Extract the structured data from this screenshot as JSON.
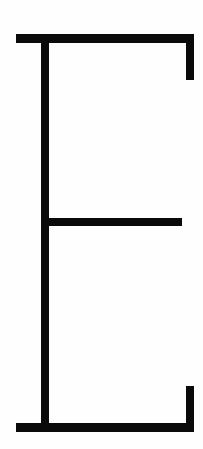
{
  "figure": {
    "letter": "E",
    "stroke_color": "#0a0a0a",
    "background_color": "#fefefe",
    "parts": [
      {
        "name": "top-bar",
        "x": 16,
        "y": 34,
        "w": 178,
        "h": 9
      },
      {
        "name": "top-serif",
        "x": 186,
        "y": 34,
        "w": 8,
        "h": 46
      },
      {
        "name": "stem",
        "x": 41,
        "y": 34,
        "w": 8,
        "h": 398
      },
      {
        "name": "middle-bar",
        "x": 41,
        "y": 218,
        "w": 141,
        "h": 8
      },
      {
        "name": "bottom-bar",
        "x": 16,
        "y": 423,
        "w": 178,
        "h": 9
      },
      {
        "name": "bottom-serif",
        "x": 186,
        "y": 386,
        "w": 8,
        "h": 46
      }
    ]
  }
}
